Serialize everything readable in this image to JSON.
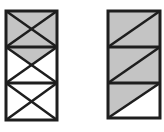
{
  "figure": {
    "colors": {
      "fill": "#c4c4c4",
      "stroke": "#1e1e1e",
      "background": "#ffffff"
    },
    "left_frame": {
      "cells": 3,
      "bracing": "x-cross",
      "shaded": "top cell fully; second cell upper triangle"
    },
    "right_frame": {
      "cells": 3,
      "bracing": "single-diagonal",
      "shaded": "top two cells fully; bottom cell upper-left triangle"
    }
  }
}
